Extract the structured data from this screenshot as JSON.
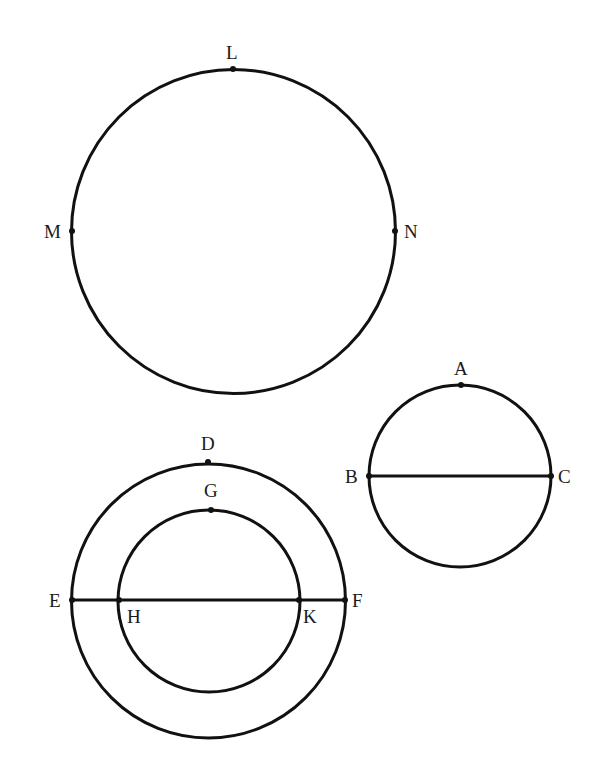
{
  "figures": {
    "circle_LMN": {
      "center": [
        233.5,
        231.5
      ],
      "radius": 162,
      "points": {
        "L": {
          "label": "L",
          "at": [
            233,
            68
          ]
        },
        "M": {
          "label": "M",
          "at": [
            72,
            231
          ]
        },
        "N": {
          "label": "N",
          "at": [
            395,
            231
          ]
        }
      }
    },
    "circle_ABC": {
      "center": [
        460,
        476
      ],
      "radius": 91,
      "diameter": "BC",
      "points": {
        "A": {
          "label": "A",
          "at": [
            461,
            385
          ]
        },
        "B": {
          "label": "B",
          "at": [
            369,
            476
          ]
        },
        "C": {
          "label": "C",
          "at": [
            551,
            476
          ]
        }
      }
    },
    "circle_DEF": {
      "center": [
        208.5,
        601
      ],
      "radius": 137,
      "diameter": "EF",
      "points": {
        "D": {
          "label": "D",
          "at": [
            208,
            462
          ]
        },
        "E": {
          "label": "E",
          "at": [
            72,
            600
          ]
        },
        "F": {
          "label": "F",
          "at": [
            345,
            600
          ]
        }
      }
    },
    "circle_GHK": {
      "center": [
        209,
        601
      ],
      "radius": 91,
      "points": {
        "G": {
          "label": "G",
          "at": [
            211,
            510
          ]
        },
        "H": {
          "label": "H",
          "at": [
            119,
            600
          ]
        },
        "K": {
          "label": "K",
          "at": [
            299,
            600
          ]
        }
      }
    }
  }
}
